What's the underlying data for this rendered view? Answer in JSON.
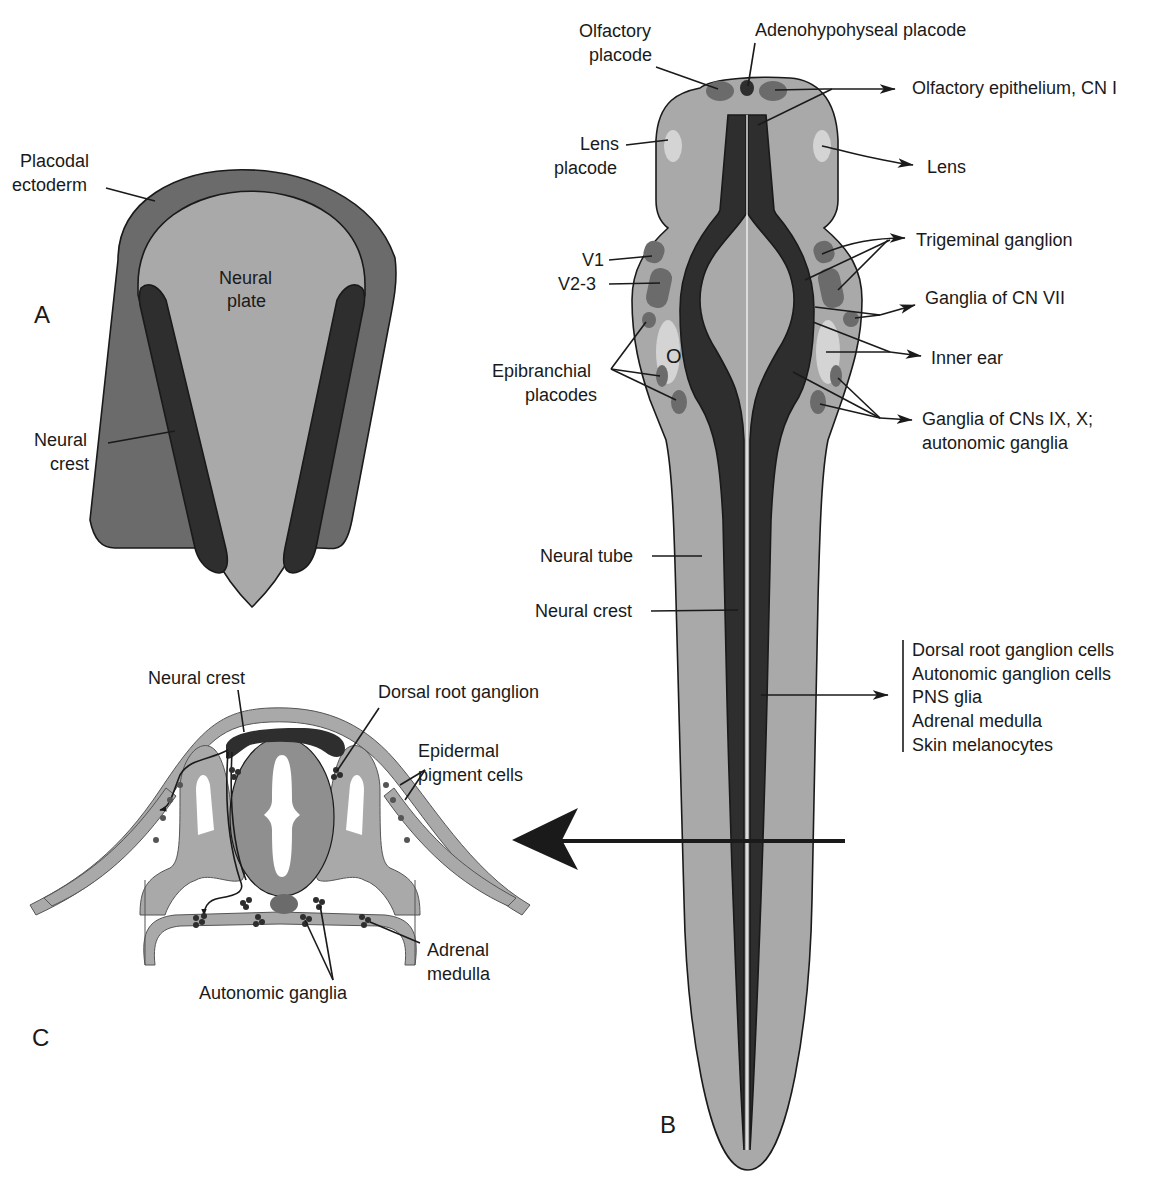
{
  "colors": {
    "light_gray": "#a9a9a9",
    "mid_gray": "#6b6b6b",
    "dark_gray": "#2e2e2e",
    "pale_gray": "#d4d4d4",
    "outline": "#1a1a1a",
    "background": "#ffffff"
  },
  "panels": {
    "A": {
      "letter": "A",
      "labels": {
        "placodal_ectoderm_1": "Placodal",
        "placodal_ectoderm_2": "ectoderm",
        "neural_plate_1": "Neural",
        "neural_plate_2": "plate",
        "neural_crest_1": "Neural",
        "neural_crest_2": "crest"
      }
    },
    "B": {
      "letter": "B",
      "labels": {
        "olfactory_placode_1": "Olfactory",
        "olfactory_placode_2": "placode",
        "adenohypophyseal_placode": "Adenohypohyseal placode",
        "olfactory_epithelium": "Olfactory epithelium, CN I",
        "lens_placode_1": "Lens",
        "lens_placode_2": "placode",
        "lens": "Lens",
        "v1": "V1",
        "v2_3": "V2-3",
        "trigeminal_ganglion": "Trigeminal ganglion",
        "ganglia_cn_vii": "Ganglia of CN VII",
        "otic": "O",
        "inner_ear": "Inner ear",
        "epibranchial_1": "Epibranchial",
        "epibranchial_2": "placodes",
        "ganglia_ix_x_1": "Ganglia of CNs IX, X;",
        "ganglia_ix_x_2": "autonomic ganglia",
        "neural_tube": "Neural tube",
        "neural_crest": "Neural crest"
      },
      "derivatives": [
        "Dorsal root ganglion cells",
        "Autonomic ganglion cells",
        "PNS glia",
        "Adrenal medulla",
        "Skin melanocytes"
      ]
    },
    "C": {
      "letter": "C",
      "labels": {
        "neural_crest": "Neural crest",
        "dorsal_root_ganglion": "Dorsal root ganglion",
        "epidermal_pigment_1": "Epidermal",
        "epidermal_pigment_2": "pigment cells",
        "adrenal_medulla_1": "Adrenal",
        "adrenal_medulla_2": "medulla",
        "autonomic_ganglia": "Autonomic ganglia"
      }
    }
  }
}
